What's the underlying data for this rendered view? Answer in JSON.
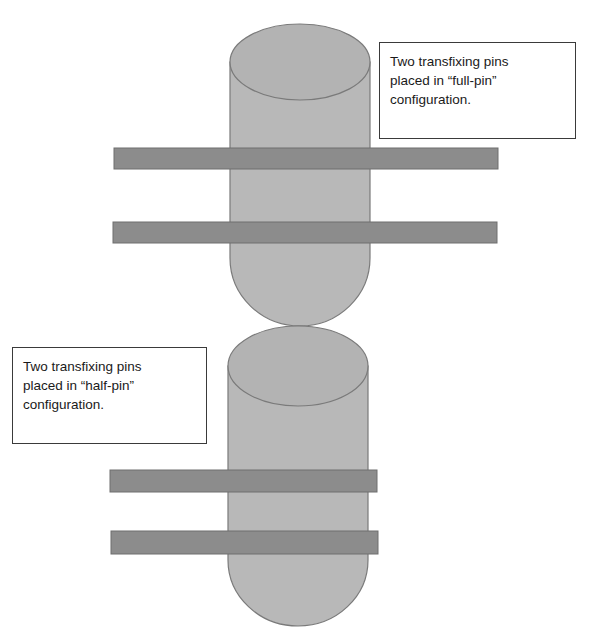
{
  "diagram": {
    "colors": {
      "bone_fill": "#b8b8b8",
      "bone_stroke": "#7a7a7a",
      "pin_fill": "#8c8c8c",
      "pin_stroke": "#6e6e6e",
      "box_border": "#3a3a3a"
    },
    "labels": {
      "full_pin": {
        "lines": [
          "Two transfixing pins",
          "placed in “full-pin”",
          "configuration."
        ]
      },
      "half_pin": {
        "lines": [
          "Two transfixing pins",
          "placed in “half-pin”",
          "configuration."
        ]
      }
    },
    "elements": [
      {
        "id": "upper-bone",
        "type": "cylinder"
      },
      {
        "id": "full-pin-1",
        "type": "pin",
        "configuration": "full-pin"
      },
      {
        "id": "full-pin-2",
        "type": "pin",
        "configuration": "full-pin"
      },
      {
        "id": "lower-bone",
        "type": "cylinder"
      },
      {
        "id": "half-pin-1",
        "type": "pin",
        "configuration": "half-pin"
      },
      {
        "id": "half-pin-2",
        "type": "pin",
        "configuration": "half-pin"
      }
    ]
  }
}
